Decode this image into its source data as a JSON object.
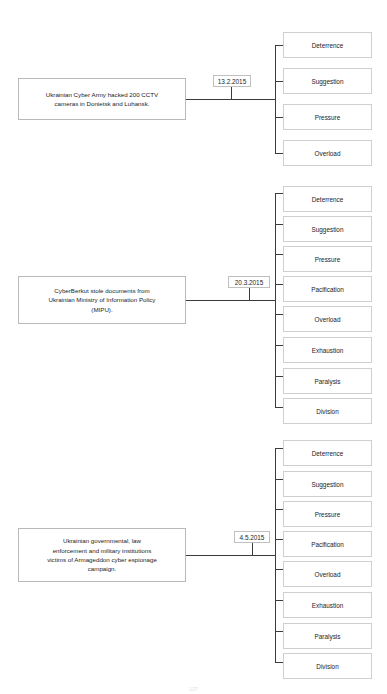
{
  "document": {
    "title": "Ukrainian cyber incidents and information-influence effects",
    "page_number": "127"
  },
  "groups": [
    {
      "id": "group-1",
      "event_text": "Ukrainian Cyber Army hacked 200 CCTV\ncameras in Donietsk and Luhansk.",
      "date": "13.2.2015",
      "effects": [
        "Deterrence",
        "Suggestion",
        "Pressure",
        "Overload"
      ]
    },
    {
      "id": "group-2",
      "event_text": "CyberBerkut stole documents from\nUkrainian Ministry of Information Policy\n(MIPU).",
      "date": "20.3.2015",
      "effects": [
        "Deterrence",
        "Suggestion",
        "Pressure",
        "Pacification",
        "Overload",
        "Exhaustion",
        "Paralysis",
        "Division"
      ]
    },
    {
      "id": "group-3",
      "event_text": "Ukrainian governmental, law\nenforcement and military institutions\nvictims of Armageddon cyber espionage\ncampaign.",
      "date": "4.5.2015",
      "effects": [
        "Deterrence",
        "Suggestion",
        "Pressure",
        "Pacification",
        "Overload",
        "Exhaustion",
        "Paralysis",
        "Division"
      ]
    }
  ],
  "layout": {
    "line_color": "#3b3b3b",
    "box_border_color": "#cfcfcf",
    "background": "#ffffff"
  }
}
